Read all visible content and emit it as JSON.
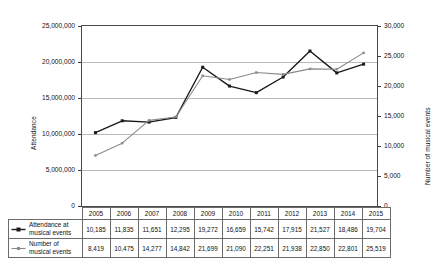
{
  "chart_data": {
    "type": "line",
    "title": "",
    "xlabel": "",
    "categories": [
      "2005",
      "2006",
      "2007",
      "2008",
      "2009",
      "2010",
      "2011",
      "2012",
      "2013",
      "2014",
      "2015"
    ],
    "grid": true,
    "legend_position": "table-left",
    "series": [
      {
        "name": "Attendance at musical events",
        "axis": "left",
        "color": "#1a1a1a",
        "marker": "square",
        "values": [
          10185000,
          11835000,
          11651000,
          12295000,
          19272000,
          16659000,
          15742000,
          17915000,
          21527000,
          18486000,
          19704000
        ],
        "labels": [
          "10,185",
          "11,835",
          "11,651",
          "12,295",
          "19,272",
          "16,659",
          "15,742",
          "17,915",
          "21,527",
          "18,486",
          "19,704"
        ]
      },
      {
        "name": "Number of musical events",
        "axis": "right",
        "color": "#8a8a8a",
        "marker": "square",
        "values": [
          8419,
          10475,
          14277,
          14842,
          21699,
          21090,
          22251,
          21938,
          22850,
          22801,
          25519
        ],
        "labels": [
          "8,419",
          "10,475",
          "14,277",
          "14,842",
          "21,699",
          "21,090",
          "22,251",
          "21,938",
          "22,850",
          "22,801",
          "25,519"
        ]
      }
    ],
    "y_left": {
      "label": "Attendance",
      "min": 0,
      "max": 25000000,
      "step": 5000000,
      "ticks": [
        "0",
        "5,000,000",
        "10,000,000",
        "15,000,000",
        "20,000,000",
        "25,000,000"
      ]
    },
    "y_right": {
      "label": "Number of musical events",
      "min": 0,
      "max": 30000,
      "step": 5000,
      "ticks": [
        "0",
        "5,000",
        "10,000",
        "15,000",
        "20,000",
        "25,000",
        "30,000"
      ]
    }
  },
  "table": {
    "corner": "",
    "year_headers": [
      "2005",
      "2006",
      "2007",
      "2008",
      "2009",
      "2010",
      "2011",
      "2012",
      "2013",
      "2014",
      "2015"
    ],
    "rows": [
      {
        "legend_line1": "Attendance at",
        "legend_line2": "musical events",
        "values": [
          "10,185",
          "11,835",
          "11,651",
          "12,295",
          "19,272",
          "16,659",
          "15,742",
          "17,915",
          "21,527",
          "18,486",
          "19,704"
        ]
      },
      {
        "legend_line1": "Number of",
        "legend_line2": "musical events",
        "values": [
          "8,419",
          "10,475",
          "14,277",
          "14,842",
          "21,699",
          "21,090",
          "22,251",
          "21,938",
          "22,850",
          "22,801",
          "25,519"
        ]
      }
    ]
  }
}
